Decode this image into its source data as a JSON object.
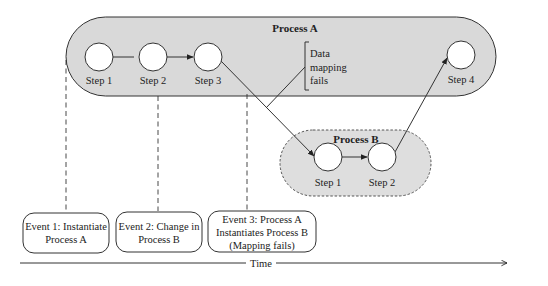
{
  "process_a": {
    "title": "Process A",
    "fill": "#d9d9d9",
    "steps": [
      {
        "label": "Step 1"
      },
      {
        "label": "Step 2"
      },
      {
        "label": "Step 3"
      },
      {
        "label": "Step 4"
      }
    ],
    "annotation": [
      "Data",
      "mapping",
      "fails"
    ]
  },
  "process_b": {
    "title": "Process B",
    "fill": "#dedede",
    "steps": [
      {
        "label": "Step 1"
      },
      {
        "label": "Step 2"
      }
    ]
  },
  "events": [
    {
      "lines": [
        "Event 1: Instantiate",
        "Process A"
      ]
    },
    {
      "lines": [
        "Event 2: Change in",
        "Process B"
      ]
    },
    {
      "lines": [
        "Event 3: Process A",
        "Instantiates Process B",
        "(Mapping fails)"
      ]
    }
  ],
  "timeline": {
    "label": "Time"
  }
}
